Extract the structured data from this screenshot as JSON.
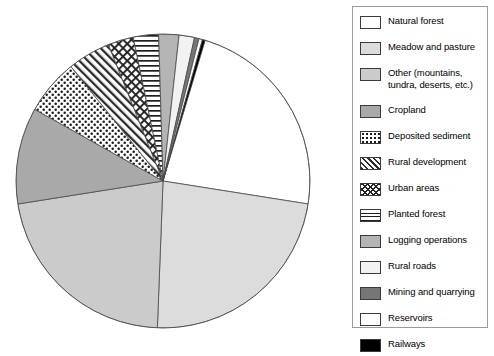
{
  "chart_data": {
    "type": "pie",
    "title": "",
    "legend_position": "right",
    "grid": false,
    "categories": [
      "Natural forest",
      "Meadow and pasture",
      "Other (mountains,\ntundra, deserts, etc.)",
      "Cropland",
      "Deposited sediment",
      "Rural development",
      "Urban areas",
      "Planted forest",
      "Logging operations",
      "Rural roads",
      "Mining and quarrying",
      "Reservoirs",
      "Railways"
    ],
    "values": [
      27.5,
      23.1,
      21.9,
      10.6,
      6.1,
      4.7,
      2.8,
      2.8,
      2.2,
      1.7,
      0.5,
      0.4,
      0.3
    ],
    "units": "percent",
    "slice_angles_deg": [
      99.0,
      83.2,
      78.8,
      38.2,
      22.0,
      17.0,
      10.1,
      10.0,
      8.0,
      6.1,
      1.8,
      1.4,
      1.1
    ],
    "start_angle_deg": 0,
    "direction": "clockwise",
    "patterns": [
      "solid-white",
      "solid-very-light-gray",
      "solid-light-gray",
      "solid-medium-gray",
      "dotted",
      "diagonal-hatch",
      "cross-hatch",
      "horizontal-lines",
      "solid-gray",
      "solid-near-white",
      "solid-dark-gray",
      "solid-white",
      "solid-black"
    ],
    "colors": [
      "#ffffff",
      "#dcdcdc",
      "#cbcbcb",
      "#a9a9a9",
      "#ffffff",
      "#ffffff",
      "#ffffff",
      "#ffffff",
      "#b4b4b4",
      "#f2f2f2",
      "#767676",
      "#ffffff",
      "#000000"
    ]
  },
  "legend": {
    "items": [
      {
        "label": "Natural forest",
        "pattern": "solid-white"
      },
      {
        "label": "Meadow and pasture",
        "pattern": "solid-very-light-gray"
      },
      {
        "label": "Other (mountains,\ntundra, deserts, etc.)",
        "pattern": "solid-light-gray"
      },
      {
        "label": "Cropland",
        "pattern": "solid-medium-gray"
      },
      {
        "label": "Deposited sediment",
        "pattern": "dotted"
      },
      {
        "label": "Rural development",
        "pattern": "diagonal-hatch"
      },
      {
        "label": "Urban areas",
        "pattern": "cross-hatch"
      },
      {
        "label": "Planted forest",
        "pattern": "horizontal-lines"
      },
      {
        "label": "Logging operations",
        "pattern": "solid-gray"
      },
      {
        "label": "Rural roads",
        "pattern": "solid-near-white"
      },
      {
        "label": "Mining and quarrying",
        "pattern": "solid-dark-gray"
      },
      {
        "label": "Reservoirs",
        "pattern": "solid-white"
      },
      {
        "label": "Railways",
        "pattern": "solid-black"
      }
    ]
  }
}
